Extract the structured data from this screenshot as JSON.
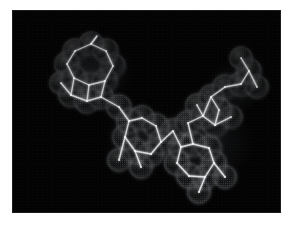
{
  "figure": {
    "caption": "",
    "background_color": "#ffffff",
    "canvas_color": "#030303",
    "wireframe_color": "#f2f4f6",
    "surface_dot_color": "#b9c2cc",
    "canvas": {
      "x": 13,
      "y": 11,
      "width": 267,
      "height": 201
    }
  },
  "molecule": {
    "name": "molecular-model",
    "representation": "wireframe-with-dotted-van-der-waals-surface",
    "shape": "bent V-shaped three-lobed assembly",
    "ring_systems": [
      {
        "id": "upper-left-aromatic-cluster",
        "center": [
          78,
          62
        ],
        "description": "fused aromatic hexagons with pendant methyl groups"
      },
      {
        "id": "center-aliphatic-cluster",
        "center": [
          128,
          128
        ],
        "description": "puckered fused ring cluster at the bend of the molecule"
      },
      {
        "id": "lower-right-aromatic-cluster",
        "center": [
          190,
          140
        ],
        "description": "fused aromatic hexagons forming the lower right lobe"
      },
      {
        "id": "upper-right-cluster",
        "center": [
          222,
          78
        ],
        "description": "terminal ring cluster with branching substituents"
      }
    ],
    "atoms": [
      {
        "id": "a1",
        "x": 62,
        "y": 40,
        "r": 13
      },
      {
        "id": "a2",
        "x": 78,
        "y": 33,
        "r": 13
      },
      {
        "id": "a3",
        "x": 93,
        "y": 40,
        "r": 13
      },
      {
        "id": "a4",
        "x": 100,
        "y": 55,
        "r": 13
      },
      {
        "id": "a5",
        "x": 92,
        "y": 70,
        "r": 13
      },
      {
        "id": "a6",
        "x": 76,
        "y": 74,
        "r": 13
      },
      {
        "id": "a7",
        "x": 61,
        "y": 67,
        "r": 13
      },
      {
        "id": "a8",
        "x": 54,
        "y": 53,
        "r": 13
      },
      {
        "id": "a9",
        "x": 58,
        "y": 84,
        "r": 13
      },
      {
        "id": "a10",
        "x": 74,
        "y": 90,
        "r": 13
      },
      {
        "id": "a11",
        "x": 88,
        "y": 86,
        "r": 13
      },
      {
        "id": "a12",
        "x": 48,
        "y": 72,
        "r": 12
      },
      {
        "id": "a13",
        "x": 106,
        "y": 96,
        "r": 13
      },
      {
        "id": "a14",
        "x": 116,
        "y": 110,
        "r": 13
      },
      {
        "id": "a15",
        "x": 112,
        "y": 126,
        "r": 13
      },
      {
        "id": "a16",
        "x": 122,
        "y": 140,
        "r": 13
      },
      {
        "id": "a17",
        "x": 138,
        "y": 143,
        "r": 13
      },
      {
        "id": "a18",
        "x": 148,
        "y": 131,
        "r": 13
      },
      {
        "id": "a19",
        "x": 143,
        "y": 115,
        "r": 13
      },
      {
        "id": "a20",
        "x": 129,
        "y": 107,
        "r": 13
      },
      {
        "id": "a21",
        "x": 106,
        "y": 149,
        "r": 12
      },
      {
        "id": "a22",
        "x": 128,
        "y": 156,
        "r": 12
      },
      {
        "id": "a23",
        "x": 160,
        "y": 120,
        "r": 13
      },
      {
        "id": "a24",
        "x": 168,
        "y": 136,
        "r": 13
      },
      {
        "id": "a25",
        "x": 164,
        "y": 152,
        "r": 13
      },
      {
        "id": "a26",
        "x": 176,
        "y": 165,
        "r": 13
      },
      {
        "id": "a27",
        "x": 192,
        "y": 166,
        "r": 13
      },
      {
        "id": "a28",
        "x": 201,
        "y": 152,
        "r": 13
      },
      {
        "id": "a29",
        "x": 196,
        "y": 137,
        "r": 13
      },
      {
        "id": "a30",
        "x": 180,
        "y": 133,
        "r": 13
      },
      {
        "id": "a31",
        "x": 186,
        "y": 181,
        "r": 12
      },
      {
        "id": "a32",
        "x": 212,
        "y": 166,
        "r": 12
      },
      {
        "id": "a33",
        "x": 175,
        "y": 112,
        "r": 13
      },
      {
        "id": "a34",
        "x": 190,
        "y": 105,
        "r": 13
      },
      {
        "id": "a35",
        "x": 202,
        "y": 114,
        "r": 13
      },
      {
        "id": "a36",
        "x": 206,
        "y": 99,
        "r": 13
      },
      {
        "id": "a37",
        "x": 198,
        "y": 86,
        "r": 13
      },
      {
        "id": "a38",
        "x": 212,
        "y": 76,
        "r": 13
      },
      {
        "id": "a39",
        "x": 228,
        "y": 73,
        "r": 13
      },
      {
        "id": "a40",
        "x": 236,
        "y": 60,
        "r": 13
      },
      {
        "id": "a41",
        "x": 228,
        "y": 47,
        "r": 12
      },
      {
        "id": "a42",
        "x": 244,
        "y": 76,
        "r": 12
      },
      {
        "id": "a43",
        "x": 218,
        "y": 106,
        "r": 12
      },
      {
        "id": "a44",
        "x": 184,
        "y": 94,
        "r": 12
      }
    ],
    "bonds": [
      [
        "a1",
        "a2"
      ],
      [
        "a2",
        "a3"
      ],
      [
        "a3",
        "a4"
      ],
      [
        "a4",
        "a5"
      ],
      [
        "a5",
        "a6"
      ],
      [
        "a6",
        "a7"
      ],
      [
        "a7",
        "a8"
      ],
      [
        "a8",
        "a1"
      ],
      [
        "a7",
        "a9"
      ],
      [
        "a9",
        "a10"
      ],
      [
        "a10",
        "a11"
      ],
      [
        "a11",
        "a5"
      ],
      [
        "a6",
        "a10"
      ],
      [
        "a9",
        "a12"
      ],
      [
        "a2",
        "a2m"
      ],
      [
        "a11",
        "a13"
      ],
      [
        "a13",
        "a14"
      ],
      [
        "a14",
        "a15"
      ],
      [
        "a15",
        "a16"
      ],
      [
        "a16",
        "a17"
      ],
      [
        "a17",
        "a18"
      ],
      [
        "a18",
        "a19"
      ],
      [
        "a19",
        "a20"
      ],
      [
        "a20",
        "a14"
      ],
      [
        "a15",
        "a21"
      ],
      [
        "a16",
        "a22"
      ],
      [
        "a18",
        "a23"
      ],
      [
        "a23",
        "a24"
      ],
      [
        "a24",
        "a25"
      ],
      [
        "a25",
        "a26"
      ],
      [
        "a26",
        "a27"
      ],
      [
        "a27",
        "a28"
      ],
      [
        "a28",
        "a29"
      ],
      [
        "a29",
        "a30"
      ],
      [
        "a30",
        "a24"
      ],
      [
        "a27",
        "a31"
      ],
      [
        "a28",
        "a32"
      ],
      [
        "a30",
        "a33"
      ],
      [
        "a33",
        "a34"
      ],
      [
        "a34",
        "a35"
      ],
      [
        "a35",
        "a36"
      ],
      [
        "a36",
        "a37"
      ],
      [
        "a37",
        "a34"
      ],
      [
        "a37",
        "a38"
      ],
      [
        "a38",
        "a39"
      ],
      [
        "a39",
        "a40"
      ],
      [
        "a40",
        "a41"
      ],
      [
        "a40",
        "a42"
      ],
      [
        "a35",
        "a43"
      ],
      [
        "a34",
        "a44"
      ]
    ]
  }
}
